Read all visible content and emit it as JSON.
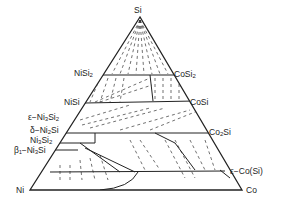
{
  "diagram": {
    "type": "ternary-phase-diagram",
    "vertices": {
      "top": "Si",
      "left": "Ni",
      "right": "Co"
    },
    "left_labels": [
      {
        "id": "nisi2",
        "base": "NiSi",
        "sub": "2"
      },
      {
        "id": "nisi",
        "base": "NiSi",
        "sub": ""
      },
      {
        "id": "eps-ni3si2",
        "prefix": "ε−",
        "base": "Ni",
        "sub": "3",
        "base2": "Si",
        "sub2": "2"
      },
      {
        "id": "delta-ni2si",
        "prefix": "δ−",
        "base": "Ni",
        "sub": "2",
        "base2": "Si",
        "sub2": ""
      },
      {
        "id": "ni3si2",
        "base": "Ni",
        "sub": "3",
        "base2": "Si",
        "sub2": "2"
      },
      {
        "id": "beta1-ni3si",
        "prefix": "β₁−",
        "base": "Ni",
        "sub": "3",
        "base2": "Si",
        "sub2": ""
      }
    ],
    "right_labels": [
      {
        "id": "cosi2",
        "base": "CoSi",
        "sub": "2"
      },
      {
        "id": "cosi",
        "base": "CoSi",
        "sub": ""
      },
      {
        "id": "co2si",
        "base": "Co",
        "sub": "2",
        "base2": "Si",
        "sub2": ""
      },
      {
        "id": "eps-co",
        "text": "ε−Co(Si)"
      }
    ],
    "line_color": "#222222"
  }
}
